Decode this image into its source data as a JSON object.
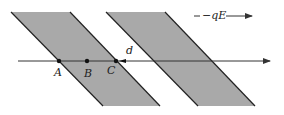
{
  "diagram": {
    "title": "",
    "colors": {
      "band_fill": "#a9a9a9",
      "band_edge": "#222222",
      "line": "#333333",
      "point": "#111111",
      "background": "#ffffff"
    },
    "bands": [
      {
        "name": "band-1",
        "points": "11,12 70,12 160,106 103,106"
      },
      {
        "name": "band-2",
        "points": "106,12 165,12 255,106 198,106"
      }
    ],
    "axis_line": {
      "x1": 18,
      "y1": 61,
      "x2": 270,
      "y2": 61
    },
    "points": [
      {
        "label": "A",
        "x": 59,
        "y": 61,
        "lx": 54,
        "ly": 76
      },
      {
        "label": "B",
        "x": 87,
        "y": 61,
        "lx": 84,
        "ly": 77
      },
      {
        "label": "C",
        "x": 116,
        "y": 61,
        "lx": 107,
        "ly": 74
      }
    ],
    "distance_label": {
      "text": "d",
      "x": 126,
      "y": 54
    },
    "force_label": {
      "text": "−qE",
      "x": 202,
      "y": 19
    }
  }
}
